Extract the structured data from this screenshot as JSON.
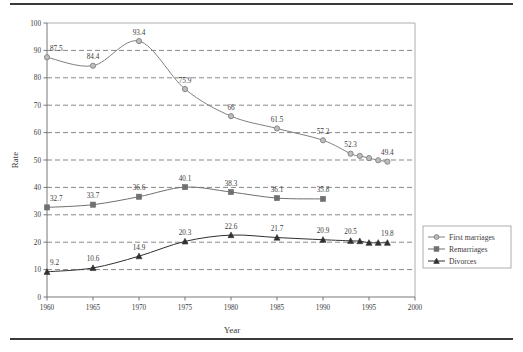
{
  "chart_data": {
    "type": "line",
    "title": "",
    "xlabel": "Year",
    "ylabel": "Rate",
    "xlim": [
      1960,
      2000
    ],
    "ylim": [
      0,
      100
    ],
    "xticks": [
      1960,
      1965,
      1970,
      1975,
      1980,
      1985,
      1990,
      1995,
      2000
    ],
    "yticks": [
      0,
      10,
      20,
      30,
      40,
      50,
      60,
      70,
      80,
      90,
      100
    ],
    "grid": "horizontal-dashed",
    "legend_position": "right",
    "series": [
      {
        "name": "First marriages",
        "marker": "circle",
        "color": "#808080",
        "x": [
          1960,
          1965,
          1970,
          1975,
          1980,
          1985,
          1990,
          1993,
          1994,
          1995,
          1996,
          1997
        ],
        "values": [
          87.5,
          84.4,
          93.4,
          75.9,
          66,
          61.5,
          57.2,
          52.3,
          51.5,
          50.7,
          49.9,
          49.4
        ],
        "labels": [
          "87.5",
          "84.4",
          "93.4",
          "75.9",
          "66",
          "61.5",
          "57.2",
          "52.3",
          "",
          "",
          "",
          "49.4"
        ]
      },
      {
        "name": "Remarriages",
        "marker": "square",
        "color": "#707070",
        "x": [
          1960,
          1965,
          1970,
          1975,
          1980,
          1985,
          1990
        ],
        "values": [
          32.7,
          33.7,
          36.6,
          40.1,
          38.3,
          36.1,
          35.8
        ],
        "labels": [
          "32.7",
          "33.7",
          "36.6",
          "40.1",
          "38.3",
          "36.1",
          "35.8"
        ]
      },
      {
        "name": "Divorces",
        "marker": "triangle",
        "color": "#303030",
        "x": [
          1960,
          1965,
          1970,
          1975,
          1980,
          1985,
          1990,
          1993,
          1994,
          1995,
          1996,
          1997
        ],
        "values": [
          9.2,
          10.6,
          14.9,
          20.3,
          22.6,
          21.7,
          20.9,
          20.5,
          20.4,
          19.8,
          19.8,
          19.8
        ],
        "labels": [
          "9.2",
          "10.6",
          "14.9",
          "20.3",
          "22.6",
          "21.7",
          "20.9",
          "20.5",
          "",
          "",
          "",
          "19.8"
        ]
      }
    ],
    "legend_entries": [
      "First marriages",
      "Remarriages",
      "Divorces"
    ]
  },
  "colors": {
    "first_marriages": "#808080",
    "remarriages": "#707070",
    "divorces": "#303030",
    "grid": "#555555",
    "axis": "#6a6a6a",
    "text": "#3b3b3b",
    "rule": "#3a3a3a"
  }
}
